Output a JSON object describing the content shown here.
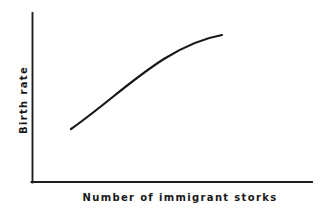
{
  "figure": {
    "background_color": "#ffffff",
    "ink_color": "#181818",
    "width": 326,
    "height": 212
  },
  "chart_data": {
    "type": "line",
    "title": "",
    "subtitle": "",
    "xlabel": "Number of immigrant storks",
    "ylabel": "Birth rate",
    "x_tick_labels": [],
    "y_tick_labels": [],
    "grid": false,
    "legend": null,
    "legend_position": "none",
    "annotations": [],
    "axes": {
      "style": "open-L",
      "x_axis_drawn": true,
      "y_axis_drawn": true,
      "ticks": false,
      "x_range_qualitative": [
        "low",
        "high"
      ],
      "y_range_qualitative": [
        "low",
        "high"
      ]
    },
    "series": [
      {
        "name": "Birth rate vs immigrant storks",
        "shape": "increasing concave-down (logarithmic / saturating)",
        "color": "#181818",
        "line_width": 2.2,
        "x": [
          0.0,
          0.1,
          0.2,
          0.3,
          0.4,
          0.5,
          0.6,
          0.7,
          0.8,
          0.9,
          1.0
        ],
        "y": [
          0.0,
          0.19,
          0.35,
          0.49,
          0.6,
          0.7,
          0.78,
          0.85,
          0.91,
          0.96,
          1.0
        ]
      }
    ],
    "pixel_path": {
      "start": [
        71,
        129
      ],
      "control_1": [
        120,
        95
      ],
      "control_2": [
        165,
        45
      ],
      "end": [
        222,
        35
      ]
    }
  },
  "labels": {
    "x_axis": "Number of immigrant storks",
    "y_axis": "Birth rate"
  }
}
